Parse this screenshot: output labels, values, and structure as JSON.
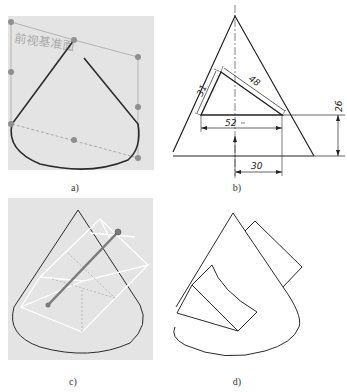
{
  "figure": {
    "panels": [
      {
        "id": "a",
        "caption": "a)",
        "plane_label": "前视基准面",
        "description": "Cone sketch on front reference plane with control points"
      },
      {
        "id": "b",
        "caption": "b)",
        "description": "Dimensioned sketch of triangular cut profile in cone"
      },
      {
        "id": "c",
        "caption": "c)",
        "description": "Cone with extruded cut preview box and direction axis"
      },
      {
        "id": "d",
        "caption": "d)",
        "description": "Resulting cone with rectangular cut-out"
      }
    ],
    "dimensions": {
      "d1": "31",
      "d2": "48",
      "d3": "52",
      "d4": "26",
      "d5": "30"
    },
    "colors": {
      "background_gray": "#e4e4e4",
      "line_dark": "#2b2b2b",
      "control_point": "#8f8f8f",
      "plane_edge": "#b0b0b0",
      "preview_box": "#ffffff",
      "axis": "#7a7a7a"
    }
  }
}
